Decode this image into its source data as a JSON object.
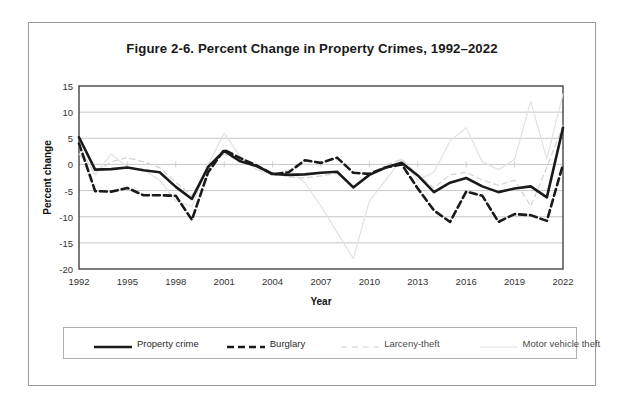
{
  "figure": {
    "title": "Figure 2-6. Percent Change in Property Crimes, 1992–2022",
    "xlabel": "Year",
    "ylabel": "Percent change"
  },
  "legend": {
    "position": "bottom",
    "items": [
      {
        "label": "Property crime",
        "style": "solid",
        "color": "#1a1a1a",
        "width": 2.6
      },
      {
        "label": "Burglary",
        "style": "dashed",
        "color": "#1a1a1a",
        "width": 2.6
      },
      {
        "label": "Larceny-theft",
        "style": "dashed",
        "color": "#d2d2d2",
        "width": 1.2
      },
      {
        "label": "Motor vehicle theft",
        "style": "solid",
        "color": "#e2e2e2",
        "width": 1.2
      }
    ]
  },
  "axes": {
    "y_ticks": [
      15,
      10,
      5,
      0,
      -5,
      -10,
      -15,
      -20
    ],
    "y_tick_labels": [
      "15",
      "10",
      "5",
      "0",
      "-5",
      "-10",
      "-15",
      "-20"
    ],
    "x_ticks": [
      1992,
      1995,
      1998,
      2001,
      2004,
      2007,
      2010,
      2013,
      2016,
      2019,
      2022
    ],
    "x_tick_labels": [
      "1992",
      "1995",
      "1998",
      "2001",
      "2004",
      "2007",
      "2010",
      "2013",
      "2016",
      "2019",
      "2022"
    ]
  },
  "chart_data": {
    "type": "line",
    "title": "Figure 2-6. Percent Change in Property Crimes, 1992–2022",
    "xlabel": "Year",
    "ylabel": "Percent change",
    "xlim": [
      1992,
      2022
    ],
    "ylim": [
      -20,
      15
    ],
    "grid": "horizontal",
    "legend_position": "bottom",
    "x": [
      1992,
      1993,
      1994,
      1995,
      1996,
      1997,
      1998,
      1999,
      2000,
      2001,
      2002,
      2003,
      2004,
      2005,
      2006,
      2007,
      2008,
      2009,
      2010,
      2011,
      2012,
      2013,
      2014,
      2015,
      2016,
      2017,
      2018,
      2019,
      2020,
      2021,
      2022
    ],
    "series": [
      {
        "name": "Property crime",
        "style": "solid",
        "color": "#1a1a1a",
        "values": [
          5.2,
          -1.0,
          -0.9,
          -0.6,
          -1.1,
          -1.5,
          -4.3,
          -6.6,
          -0.5,
          2.6,
          0.6,
          -0.3,
          -1.8,
          -2.0,
          -1.9,
          -1.6,
          -1.4,
          -4.4,
          -2.0,
          -0.6,
          0.3,
          -2.1,
          -5.3,
          -3.5,
          -2.6,
          -4.2,
          -5.3,
          -4.6,
          -4.2,
          -6.3,
          7.0
        ]
      },
      {
        "name": "Burglary",
        "style": "dashed",
        "color": "#1a1a1a",
        "values": [
          4.0,
          -5.1,
          -5.2,
          -4.5,
          -5.9,
          -5.9,
          -6.0,
          -10.6,
          -1.5,
          2.8,
          1.2,
          -0.2,
          -1.9,
          -1.5,
          0.8,
          0.3,
          1.3,
          -1.6,
          -1.8,
          -0.6,
          0.0,
          -4.6,
          -8.8,
          -11.0,
          -5.2,
          -6.0,
          -11.0,
          -9.5,
          -9.7,
          -10.8,
          0.0
        ]
      },
      {
        "name": "Larceny-theft",
        "style": "dashed",
        "color": "#d2d2d2",
        "values": [
          2.0,
          -1.5,
          0.5,
          1.3,
          0.5,
          -0.6,
          -3.4,
          -6.0,
          -0.3,
          2.0,
          0.6,
          0.0,
          -1.6,
          -2.4,
          -2.6,
          -2.2,
          -1.7,
          -4.1,
          -2.1,
          -0.2,
          1.0,
          -2.0,
          -4.5,
          -2.0,
          -1.5,
          -3.0,
          -4.0,
          -3.0,
          -8.0,
          -0.5,
          7.5
        ]
      },
      {
        "name": "Motor vehicle theft",
        "style": "solid",
        "color": "#e2e2e2",
        "values": [
          3.5,
          -2.0,
          2.0,
          -0.5,
          -1.0,
          -3.0,
          -7.0,
          -8.0,
          0.0,
          6.0,
          1.5,
          -1.0,
          -2.0,
          -1.0,
          -3.5,
          -8.0,
          -13.0,
          -18.0,
          -7.0,
          -3.0,
          1.0,
          -3.0,
          -1.5,
          4.5,
          7.0,
          0.5,
          -1.0,
          1.0,
          12.0,
          1.0,
          13.5
        ]
      }
    ]
  }
}
